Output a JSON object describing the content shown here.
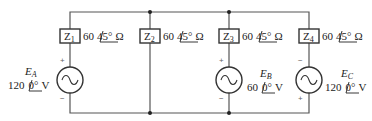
{
  "diagram": {
    "type": "ac-circuit",
    "colors": {
      "wire": "#555555",
      "box": "#333333",
      "text": "#222222"
    },
    "impedances": [
      {
        "id": "Z1",
        "label": "Z",
        "sub": "1",
        "mag": "60",
        "angle": "45°",
        "unit": "Ω"
      },
      {
        "id": "Z2",
        "label": "Z",
        "sub": "2",
        "mag": "60",
        "angle": "45°",
        "unit": "Ω"
      },
      {
        "id": "Z3",
        "label": "Z",
        "sub": "3",
        "mag": "60",
        "angle": "45°",
        "unit": "Ω"
      },
      {
        "id": "Z4",
        "label": "Z",
        "sub": "4",
        "mag": "60",
        "angle": "45°",
        "unit": "Ω"
      }
    ],
    "sources": [
      {
        "id": "EA",
        "name": "E",
        "sub": "A",
        "mag": "120",
        "angle": "0°",
        "unit": "V",
        "top_sign": "+",
        "bottom_sign": "−"
      },
      {
        "id": "EB",
        "name": "E",
        "sub": "B",
        "mag": "60",
        "angle": "0°",
        "unit": "V",
        "top_sign": "+",
        "bottom_sign": "−"
      },
      {
        "id": "EC",
        "name": "E",
        "sub": "C",
        "mag": "120",
        "angle": "0°",
        "unit": "V",
        "top_sign": "−",
        "bottom_sign": "+"
      }
    ]
  }
}
